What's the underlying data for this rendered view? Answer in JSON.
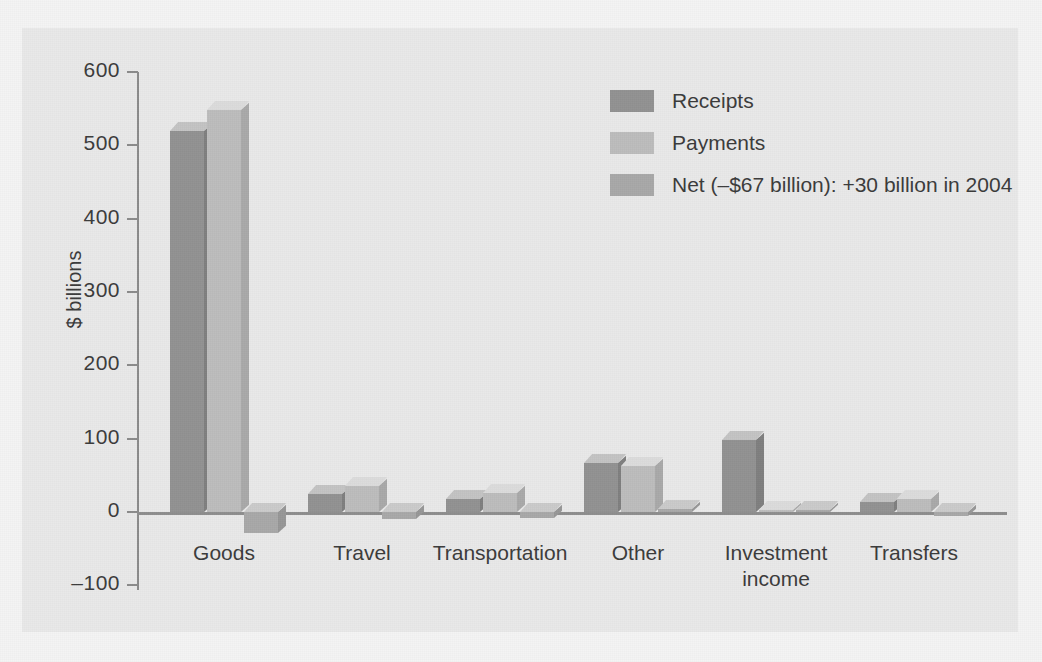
{
  "chart_data": {
    "type": "bar",
    "title": "",
    "subtitle": "",
    "xlabel": "",
    "ylabel": "$ billions",
    "ylim": [
      -100,
      600
    ],
    "yticks": [
      600,
      500,
      400,
      300,
      200,
      100,
      0,
      -100
    ],
    "ytick_labels": [
      "600",
      "500",
      "400",
      "300",
      "200",
      "100",
      "0",
      "–100"
    ],
    "grid": false,
    "legend_position": "upper-right",
    "categories": [
      "Goods",
      "Travel",
      "Transportation",
      "Other",
      "Investment income",
      "Transfers"
    ],
    "category_labels": [
      {
        "line1": "Goods",
        "line2": ""
      },
      {
        "line1": "Travel",
        "line2": ""
      },
      {
        "line1": "Transportation",
        "line2": ""
      },
      {
        "line1": "Other",
        "line2": ""
      },
      {
        "line1": "Investment",
        "line2": "income"
      },
      {
        "line1": "Transfers",
        "line2": ""
      }
    ],
    "series": [
      {
        "name": "Receipts",
        "color": "#929292",
        "values": [
          520,
          25,
          18,
          67,
          98,
          13
        ]
      },
      {
        "name": "Payments",
        "color": "#bcbcbc",
        "values": [
          548,
          35,
          26,
          63,
          3,
          18
        ]
      },
      {
        "name": "Net (–$67 billion): +30 billion in 2004",
        "color": "#a8a8a8",
        "values": [
          -28,
          -10,
          -8,
          4,
          3,
          -5
        ]
      }
    ],
    "annotations": [
      "Net (–$67 billion): +30 billion in 2004"
    ]
  },
  "legend": {
    "entries": [
      {
        "label": "Receipts",
        "color": "#929292"
      },
      {
        "label": "Payments",
        "color": "#bcbcbc"
      },
      {
        "label": "Net (–$67 billion): +30 billion in 2004",
        "color": "#a8a8a8"
      }
    ]
  },
  "axis": {
    "y_title": "$ billions",
    "y_labels": [
      "600",
      "500",
      "400",
      "300",
      "200",
      "100",
      "0",
      "–100"
    ]
  },
  "colors": {
    "panel_background": "#e9e9e9",
    "page_background": "#f4f4f4",
    "axis": "#8b8b8b",
    "text": "#3b3b3b",
    "receipts": "#929292",
    "payments": "#bcbcbc",
    "net": "#a8a8a8"
  }
}
